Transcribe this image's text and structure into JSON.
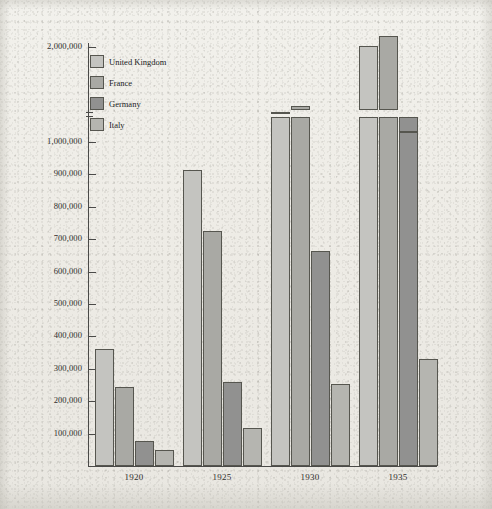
{
  "chart_data": {
    "type": "bar",
    "title": "",
    "xlabel": "",
    "ylabel": "",
    "categories": [
      "1920",
      "1925",
      "1930",
      "1935"
    ],
    "series": [
      {
        "name": "United Kingdom",
        "color": "#c4c4c0",
        "values": [
          360000,
          915000,
          1320000,
          2010000
        ]
      },
      {
        "name": "France",
        "color": "#a9a9a4",
        "values": [
          245000,
          725000,
          1380000,
          2120000
        ]
      },
      {
        "name": "Germany",
        "color": "#919190",
        "values": [
          78000,
          258000,
          665000,
          1120000
        ]
      },
      {
        "name": "Italy",
        "color": "#b5b5b0",
        "values": [
          50000,
          118000,
          252000,
          330000
        ]
      }
    ],
    "ylim": [
      0,
      2000000
    ],
    "y_axis_break": {
      "from": 1000000,
      "to": 2000000,
      "note": "scale break between 1,000,000 and 2,000,000"
    },
    "ytick_labels": [
      "2,000,000",
      "1,000,000",
      "900,000",
      "800,000",
      "700,000",
      "600,000",
      "500,000",
      "400,000",
      "300,000",
      "200,000",
      "100,000"
    ],
    "xtick_labels": [
      "1920",
      "1925",
      "1930",
      "1935"
    ],
    "grid": false,
    "legend_position": "top-left-inside",
    "legend_entries": [
      "United Kingdom",
      "France",
      "Germany",
      "Italy"
    ]
  },
  "colors": {
    "paper": "#eceae4",
    "ink": "#2f2f2d",
    "axis": "#4a4a48",
    "bar_outline": "#56564f",
    "united_kingdom": "#c4c4c0",
    "france": "#a9a9a4",
    "germany": "#919190",
    "italy": "#b5b5b0"
  }
}
